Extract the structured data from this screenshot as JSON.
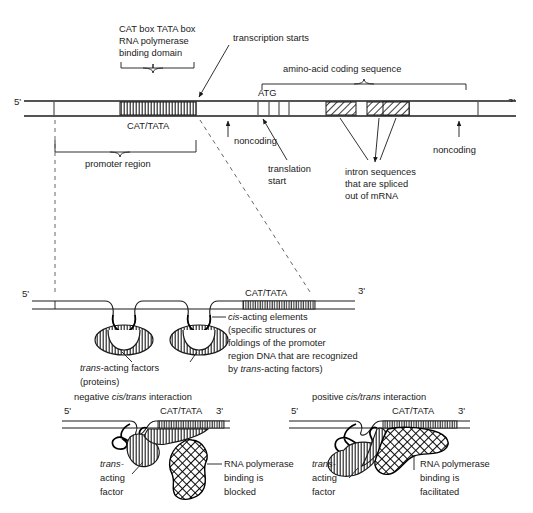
{
  "figure": {
    "background_color": "#ffffff",
    "ink_color": "#1a1a1a"
  },
  "top_panel": {
    "name": "gene-structure-map",
    "five_prime": "5'",
    "three_prime": "3'",
    "callouts": {
      "cat_tata_domain_line1": "CAT box TATA box",
      "cat_tata_domain_line2": "RNA polymerase",
      "cat_tata_domain_line3": "binding domain",
      "transcription_starts": "transcription starts",
      "amino_acid_coding": "amino-acid coding sequence",
      "atg": "ATG",
      "cat_tata_block": "CAT/TATA",
      "noncoding_left": "noncoding",
      "noncoding_right": "noncoding",
      "promoter_region": "promoter region",
      "translation_start_line1": "translation",
      "translation_start_line2": "start",
      "intron_line1": "intron sequences",
      "intron_line2": "that are spliced",
      "intron_line3": "out of mRNA"
    }
  },
  "middle_panel": {
    "name": "cis-acting-elements-diagram",
    "five_prime": "5'",
    "three_prime": "3'",
    "cat_tata_block": "CAT/TATA",
    "cis_line1": "cis-acting elements",
    "cis_line1_italic": "cis",
    "cis_line1_rest": "-acting elements",
    "cis_line2": "(specific structures or",
    "cis_line3": "foldings of the promoter",
    "cis_line4": "region DNA that are recognized",
    "cis_line5_italic": "by trans-acting factors)",
    "cis_line5_pre": "by ",
    "cis_line5_ital": "trans",
    "cis_line5_post": "-acting factors)",
    "trans_factors_line1_ital": "trans",
    "trans_factors_line1_rest": "-acting factors",
    "trans_factors_line2": "(proteins)"
  },
  "bottom_left_panel": {
    "name": "negative-cis-trans-interaction",
    "heading_pre": "negative ",
    "heading_ital": "cis/trans",
    "heading_post": " interaction",
    "five_prime": "5'",
    "three_prime": "3'",
    "cat_tata_block": "CAT/TATA",
    "trans_line1_ital": "trans-",
    "trans_line2": "acting",
    "trans_line3": "factor",
    "result_line1": "RNA polymerase",
    "result_line2": "binding is",
    "result_line3": "blocked"
  },
  "bottom_right_panel": {
    "name": "positive-cis-trans-interaction",
    "heading_pre": "positive ",
    "heading_ital": "cis/trans",
    "heading_post": " interaction",
    "five_prime": "5'",
    "three_prime": "3'",
    "cat_tata_block": "CAT/TATA",
    "trans_line1_ital": "trans-",
    "trans_line2": "acting",
    "trans_line3": "factor",
    "result_line1": "RNA polymerase",
    "result_line2": "binding is",
    "result_line3": "facilitated"
  }
}
